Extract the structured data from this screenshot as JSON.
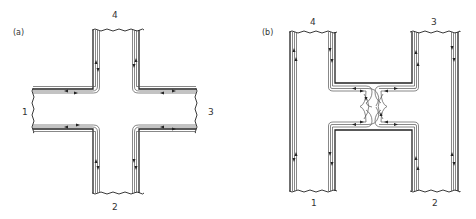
{
  "figure": {
    "panels": [
      {
        "id": "a",
        "label": "(a)",
        "description": "Cross-shaped four-terminal junction with edge channels following the boundary",
        "terminals": [
          {
            "id": "1",
            "label": "1",
            "position": "left"
          },
          {
            "id": "2",
            "label": "2",
            "position": "bottom"
          },
          {
            "id": "3",
            "label": "3",
            "position": "right"
          },
          {
            "id": "4",
            "label": "4",
            "position": "top"
          }
        ]
      },
      {
        "id": "b",
        "label": "(b)",
        "description": "H-shaped four-terminal device with constriction in the crossbar; edge channels partially transmitted and reflected at the constriction",
        "terminals": [
          {
            "id": "1",
            "label": "1",
            "position": "bottom-left"
          },
          {
            "id": "2",
            "label": "2",
            "position": "bottom-right"
          },
          {
            "id": "3",
            "label": "3",
            "position": "top-right"
          },
          {
            "id": "4",
            "label": "4",
            "position": "top-left"
          }
        ]
      }
    ],
    "colors": {
      "line": "#222222",
      "channel": "#555555",
      "background": "#ffffff",
      "text": "#333333"
    }
  }
}
